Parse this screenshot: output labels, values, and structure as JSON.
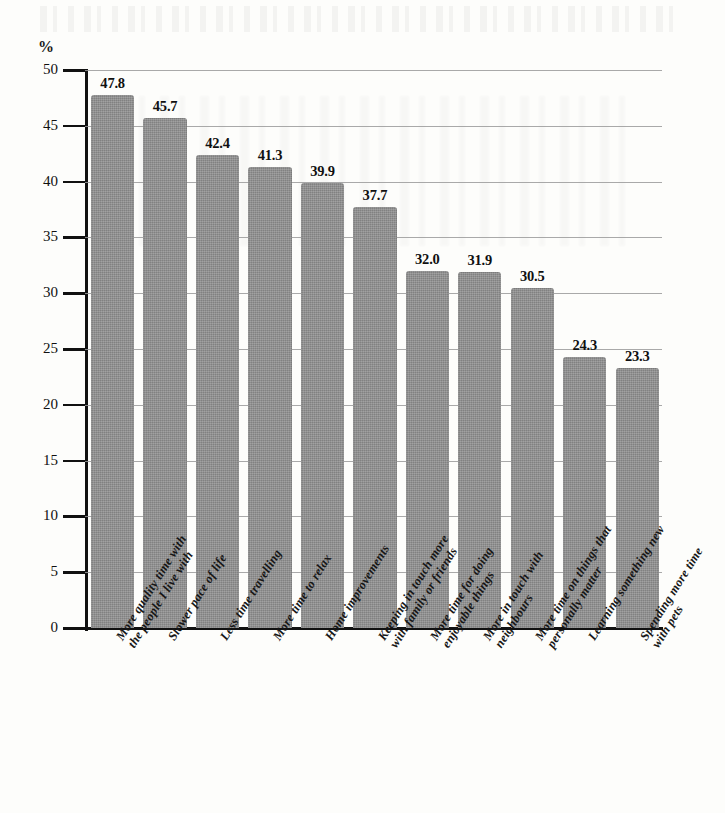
{
  "chart_data": {
    "type": "bar",
    "title": "",
    "subtitle": "",
    "xlabel": "",
    "ylabel": "%",
    "ylim": [
      0,
      50
    ],
    "ytick_step": 5,
    "yticks": [
      "50",
      "45",
      "40",
      "35",
      "30",
      "25",
      "20",
      "15",
      "10",
      "5",
      "0"
    ],
    "grid": true,
    "grid_axis": "y",
    "legend": false,
    "legend_position": "none",
    "bar_color": "#8c8c8c",
    "orientation": "vertical",
    "value_label_format": "one-decimal",
    "categories": [
      "More quality time with the people I live with",
      "Slower pace of life",
      "Less time travelling",
      "More time to relax",
      "Home improvements",
      "Keeping in touch more with family or friends",
      "More time for doing enjoyable things",
      "More in touch with neighbours",
      "More time on things that personally matter",
      "Learning something new",
      "Spending more time with pets"
    ],
    "category_lines": [
      [
        "More quality time with",
        "the people I live with"
      ],
      [
        "Slower pace of life"
      ],
      [
        "Less time travelling"
      ],
      [
        "More time to relax"
      ],
      [
        "Home improvements"
      ],
      [
        "Keeping in touch more",
        "with family or friends"
      ],
      [
        "More time for doing",
        "enjoyable things"
      ],
      [
        "More in touch with",
        "neighbours"
      ],
      [
        "More time on things that",
        "personally matter"
      ],
      [
        "Learning something new"
      ],
      [
        "Spending more time",
        "with pets"
      ]
    ],
    "values": [
      47.8,
      45.7,
      42.4,
      41.3,
      39.9,
      37.7,
      32.0,
      31.9,
      30.5,
      24.3,
      23.3
    ],
    "value_labels": [
      "47.8",
      "45.7",
      "42.4",
      "41.3",
      "39.9",
      "37.7",
      "32.0",
      "31.9",
      "30.5",
      "24.3",
      "23.3"
    ]
  }
}
